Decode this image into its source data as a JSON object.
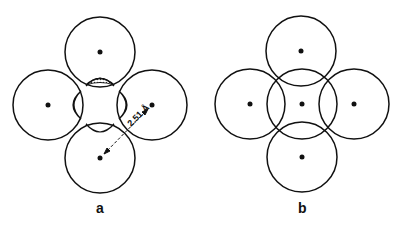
{
  "panels": [
    {
      "id": "a",
      "label": "a",
      "circles": [
        {
          "cx": 100,
          "cy": 52,
          "r": 35
        },
        {
          "cx": 48,
          "cy": 105,
          "r": 35
        },
        {
          "cx": 152,
          "cy": 105,
          "r": 35
        },
        {
          "cx": 100,
          "cy": 158,
          "r": 35
        }
      ],
      "distance_label": "2.51 Å"
    },
    {
      "id": "b",
      "label": "b",
      "circles": [
        {
          "cx": 301,
          "cy": 51,
          "r": 35
        },
        {
          "cx": 250,
          "cy": 104,
          "r": 35
        },
        {
          "cx": 302,
          "cy": 104,
          "r": 35
        },
        {
          "cx": 354,
          "cy": 104,
          "r": 35
        },
        {
          "cx": 302,
          "cy": 157,
          "r": 35
        }
      ]
    }
  ],
  "colors": {
    "stroke": "#111111",
    "background": "#ffffff"
  }
}
